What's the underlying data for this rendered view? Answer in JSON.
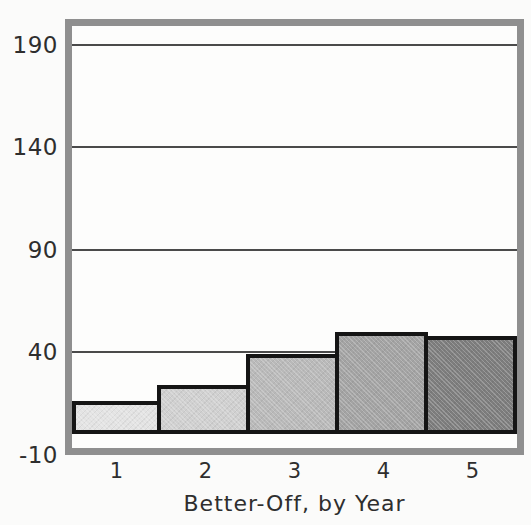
{
  "chart_data": {
    "type": "bar",
    "categories": [
      "1",
      "2",
      "3",
      "4",
      "5"
    ],
    "values": [
      16,
      24,
      39,
      50,
      48
    ],
    "title": "",
    "xlabel": "Better-Off, by Year",
    "ylabel": "",
    "yticks": [
      190,
      140,
      90,
      40,
      -10
    ],
    "gridlines": [
      190,
      140,
      90,
      40
    ],
    "ylim": [
      -10,
      200
    ],
    "grid": true,
    "legend": false,
    "bar_colors": [
      "#e3e3e3",
      "#d0d0d0",
      "#b9b9b9",
      "#a3a3a3",
      "#7d7d7d"
    ],
    "bar_border_color": "#151515",
    "baseline_color": "#151515",
    "gridline_color": "#4a4a4a",
    "frame_color": "#8f8f8f",
    "background_color": "#fbfbfa",
    "text_color": "#2e2e2e"
  }
}
